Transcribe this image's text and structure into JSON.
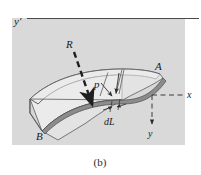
{
  "figure": {
    "caption": "(b)",
    "background_color": "#d9d9d9",
    "page_color": "#ffffff",
    "beam_fill": "#ebebeb",
    "beam_edge_fill": "#8c8c8c",
    "line_color": "#3b3b3b"
  },
  "labels": {
    "y_prime": "y′",
    "R": "R",
    "p": "p",
    "A": "A",
    "B": "B",
    "dL": "dL",
    "x": "x",
    "y": "y"
  },
  "annotations": {
    "radius_arrow_name": "R",
    "pressure_arrow_name": "p",
    "element_length_name": "dL",
    "axis_horizontal_name": "x",
    "axis_vertical_name": "y",
    "reference_axis_name": "y′",
    "curve_start_point": "A",
    "curve_end_point": "B"
  }
}
